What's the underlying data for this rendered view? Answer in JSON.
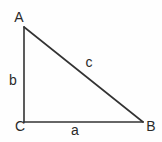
{
  "diagram": {
    "type": "right-triangle",
    "stroke_color": "#333333",
    "label_color": "#2a2a2a",
    "vertices": {
      "A": {
        "label": "A",
        "x": 24,
        "y": 27
      },
      "B": {
        "label": "B",
        "x": 143,
        "y": 122
      },
      "C": {
        "label": "C",
        "x": 24,
        "y": 122
      }
    },
    "sides": {
      "a": {
        "label": "a",
        "from": "C",
        "to": "B"
      },
      "b": {
        "label": "b",
        "from": "A",
        "to": "C"
      },
      "c": {
        "label": "c",
        "from": "A",
        "to": "B"
      }
    },
    "right_angle_at": "C"
  }
}
